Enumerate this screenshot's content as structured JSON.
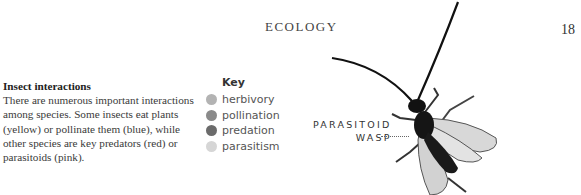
{
  "page": {
    "running_head": "ECOLOGY",
    "page_number": "18"
  },
  "article": {
    "title": "Insect interactions",
    "body": "There are numerous important interactions among species. Some insects eat plants (yellow) or pollinate them (blue), while other species are key predators (red) or parasitoids (pink)."
  },
  "key": {
    "title": "Key",
    "items": [
      {
        "label": "herbivory",
        "color": "#b3b3b3"
      },
      {
        "label": "pollination",
        "color": "#8a8a8a"
      },
      {
        "label": "predation",
        "color": "#6b6b6b"
      },
      {
        "label": "parasitism",
        "color": "#d6d6d6"
      }
    ]
  },
  "illustration": {
    "callout_line1": "PARASITOID",
    "callout_line2": "WASP",
    "subject": "parasitoid-wasp"
  }
}
